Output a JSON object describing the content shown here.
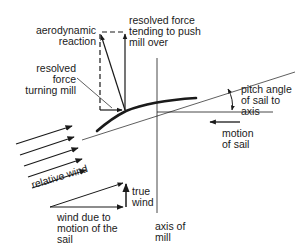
{
  "diagram": {
    "labels": {
      "aerodynamic_reaction": "aerodynamic\nreaction",
      "resolved_force_push": "resolved force\ntending to push\nmill over",
      "resolved_force_turning": "resolved\nforce\nturning mill",
      "pitch_angle": "pitch angle\nof sail to\naxis",
      "motion_of_sail": "motion\nof sail",
      "relative_wind": "relative wind",
      "true_wind": "true\nwind",
      "wind_due_to_motion": "wind due to\nmotion of the\nsail",
      "axis_of_mill": "axis of\nmill"
    },
    "colors": {
      "ink": "#1a1a1a",
      "background": "#ffffff"
    }
  }
}
